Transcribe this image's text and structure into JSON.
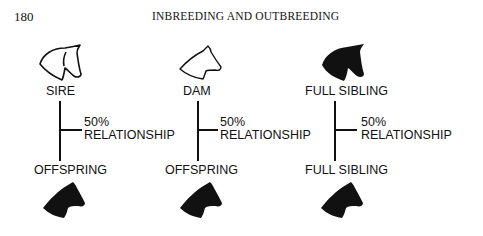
{
  "header": {
    "page_number": "180",
    "running_title": "INBREEDING AND OUTBREEDING"
  },
  "figure": {
    "groups": [
      {
        "top_label": "SIRE",
        "top_icon": "horse-head-outline-icon",
        "relationship_percent": "50%",
        "relationship_label": "RELATIONSHIP",
        "bottom_label": "OFFSPRING",
        "bottom_icon": "horse-head-solid-icon"
      },
      {
        "top_label": "DAM",
        "top_icon": "horse-head-outline-icon",
        "relationship_percent": "50%",
        "relationship_label": "RELATIONSHIP",
        "bottom_label": "OFFSPRING",
        "bottom_icon": "horse-head-solid-icon"
      },
      {
        "top_label": "FULL SIBLING",
        "top_icon": "horse-head-solid-icon",
        "relationship_percent": "50%",
        "relationship_label": "RELATIONSHIP",
        "bottom_label": "FULL SIBLING",
        "bottom_icon": "horse-head-solid-icon"
      }
    ]
  }
}
